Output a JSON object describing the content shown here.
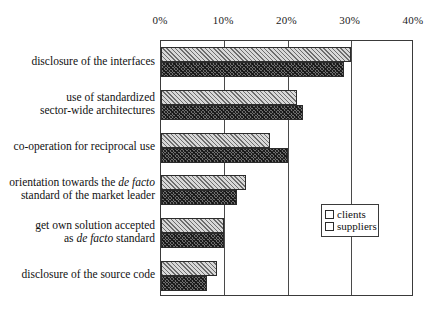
{
  "chart_data": {
    "type": "bar",
    "orientation": "horizontal",
    "title": "",
    "xlabel": "",
    "ylabel": "",
    "xlim": [
      0,
      40
    ],
    "xunit": "%",
    "xticks": [
      "0%",
      "10%",
      "20%",
      "30%",
      "40%"
    ],
    "xtick_values": [
      0,
      10,
      20,
      30,
      40
    ],
    "grid": true,
    "legend_position": "inside-right-middle",
    "categories": [
      "disclosure of the interfaces",
      "use of standardized sector-wide architectures",
      "co-operation for reciprocal use",
      "orientation towards the de facto standard of the market leader",
      "get own solution accepted as de facto standard",
      "disclosure of the source code"
    ],
    "category_lines": [
      [
        "disclosure of the interfaces"
      ],
      [
        "use of standardized",
        "sector-wide architectures"
      ],
      [
        "co-operation for reciprocal use"
      ],
      [
        "orientation towards the de facto",
        "standard of the market leader"
      ],
      [
        "get own solution accepted",
        "as de facto standard"
      ],
      [
        "disclosure of the source code"
      ]
    ],
    "series": [
      {
        "name": "clients",
        "values": [
          30.0,
          21.5,
          17.3,
          13.5,
          10.0,
          8.8
        ]
      },
      {
        "name": "suppliers",
        "values": [
          29.0,
          22.5,
          20.0,
          12.0,
          10.0,
          7.2
        ]
      }
    ]
  },
  "legend": {
    "entries": [
      {
        "label": "clients",
        "swatch": "light-hatch-swatch"
      },
      {
        "label": "suppliers",
        "swatch": "dark-hatch-swatch"
      }
    ]
  },
  "colors": {
    "clients_fill": "#d8d8d8",
    "suppliers_fill": "#6e6e6e",
    "axis": "#3a3a3a",
    "text": "#111111",
    "background": "#ffffff"
  }
}
